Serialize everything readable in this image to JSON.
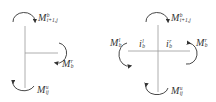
{
  "figure": {
    "left_panel": {
      "description": "Joint with beam on one side (edge joint)",
      "labels": {
        "top_moment": {
          "base": "M",
          "sup": "b",
          "sub": "i+1,j"
        },
        "right_moment": {
          "base": "M",
          "sup": "r",
          "sub": "b"
        },
        "bottom_moment": {
          "base": "M",
          "sup": "u",
          "sub": "ij"
        }
      }
    },
    "right_panel": {
      "description": "Joint with beams on both sides (interior joint)",
      "labels": {
        "top_moment": {
          "base": "M",
          "sup": "b",
          "sub": "i+1,j"
        },
        "left_moment": {
          "base": "M",
          "sup": "l",
          "sub": "b"
        },
        "right_moment": {
          "base": "M",
          "sup": "r",
          "sub": "b"
        },
        "bottom_moment": {
          "base": "M",
          "sup": "u",
          "sub": "ij"
        },
        "left_stiffness": {
          "base": "i",
          "sup": "l",
          "sub": "b"
        },
        "right_stiffness": {
          "base": "i",
          "sup": "r",
          "sub": "b"
        }
      }
    },
    "colors": {
      "line": "#999999",
      "arrow": "#333333",
      "text": "#333333"
    }
  }
}
